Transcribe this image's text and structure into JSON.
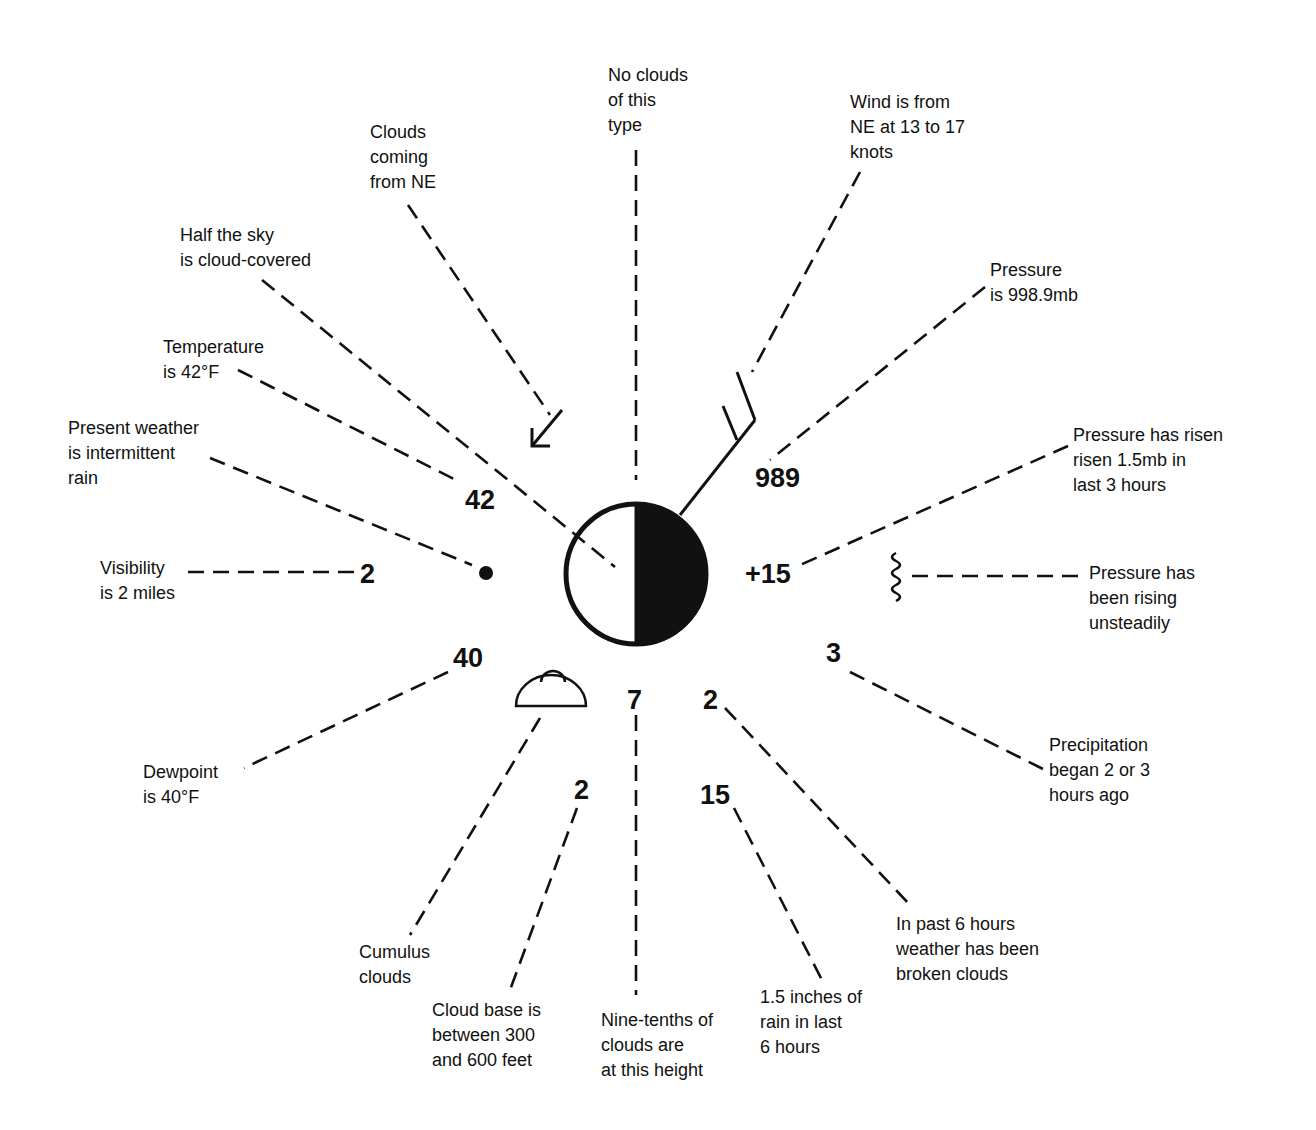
{
  "station": {
    "cloud_cover": "half",
    "center": [
      636,
      574
    ],
    "radius": 72
  },
  "values": {
    "temperature": "42",
    "pressure": "989",
    "visibility": "2",
    "pressure_change": "+15",
    "dewpoint": "40",
    "low_cloud_height_code": "7",
    "past_weather": "2",
    "precip_time": "3",
    "cloud_base": "2",
    "rainfall": "15"
  },
  "labels": {
    "no_clouds": "No clouds\nof this\ntype",
    "wind": "Wind is from\nNE at 13 to 17\nknots",
    "clouds_ne": "Clouds\ncoming\nfrom NE",
    "half_sky": "Half the sky\nis cloud-covered",
    "pressure": "Pressure\nis 998.9mb",
    "temperature": "Temperature\nis 42°F",
    "present_weather": "Present weather\nis intermittent\nrain",
    "pressure_risen": "Pressure has risen\nrisen 1.5mb in\nlast 3 hours",
    "visibility": "Visibility\nis 2 miles",
    "pressure_rising": "Pressure has\nbeen rising\nunsteadily",
    "precipitation": "Precipitation\nbegan 2 or 3\nhours ago",
    "dewpoint": "Dewpoint\nis 40°F",
    "past_weather": "In past 6 hours\nweather has been\nbroken clouds",
    "cumulus": "Cumulus\nclouds",
    "cloud_base": "Cloud base is\nbetween 300\nand 600 feet",
    "nine_tenths": "Nine-tenths of\nclouds are\nat this height",
    "rain": "1.5 inches of\nrain in last\n6 hours"
  },
  "icons": [
    "station-circle-half-filled",
    "wind-barb",
    "cloud-direction-arrow",
    "present-weather-dot",
    "cumulus-cloud-symbol",
    "pressure-tendency-squiggle"
  ]
}
